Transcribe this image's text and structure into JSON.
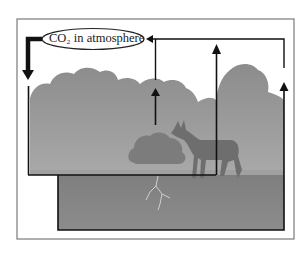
{
  "diagram": {
    "atmosphere_label": "CO₂ in atmosphere",
    "colors": {
      "frame": "#7a7a7a",
      "line": "#111111",
      "sky": "#ffffff",
      "canopy": "#8f8f8f",
      "canopy_light": "#a8a8a8",
      "ground_upper": "#9e9e9e",
      "soil": "#858585",
      "animal": "#6f6f6f",
      "shrub": "#7d7d7d",
      "roots": "#c8c8c8"
    },
    "elements": [
      {
        "name": "atmosphere",
        "label": "CO₂ in atmosphere"
      },
      {
        "name": "vegetation-canopy"
      },
      {
        "name": "shrub"
      },
      {
        "name": "deer"
      },
      {
        "name": "roots"
      },
      {
        "name": "soil"
      }
    ],
    "flows": [
      {
        "from": "atmosphere",
        "to": "vegetation-canopy",
        "style": "thick-down-arrow"
      },
      {
        "from": "vegetation-canopy",
        "to": "atmosphere",
        "style": "up-arrow"
      },
      {
        "from": "deer",
        "to": "atmosphere",
        "style": "up-arrow"
      },
      {
        "from": "soil",
        "to": "atmosphere",
        "style": "up-arrow"
      }
    ]
  }
}
